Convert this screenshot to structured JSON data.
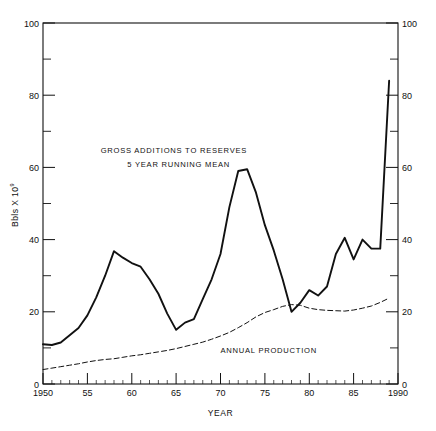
{
  "chart_data": {
    "type": "line",
    "title": "",
    "xlabel": "YEAR",
    "ylabel": "Bbls X 10",
    "ylabel_exponent": "9",
    "xlim": [
      1950,
      1990
    ],
    "ylim": [
      0,
      100
    ],
    "grid": false,
    "legend_position": "inline-annotation",
    "xticks": [
      1950,
      1955,
      1960,
      1965,
      1970,
      1975,
      1980,
      1985,
      1990
    ],
    "xtick_labels": [
      "1950",
      "55",
      "60",
      "65",
      "70",
      "75",
      "80",
      "85",
      "1990"
    ],
    "xminor_step": 1,
    "yticks": [
      0,
      20,
      40,
      60,
      80,
      100
    ],
    "ytick_labels": [
      "0",
      "20",
      "40",
      "60",
      "80",
      "100"
    ],
    "yminor_ticks": [
      10,
      30,
      50,
      70,
      90
    ],
    "right_axis_ticks": [
      0,
      20,
      40,
      60,
      80,
      100
    ],
    "right_axis_tick_labels": [
      "0",
      "20",
      "40",
      "60",
      "80",
      "100"
    ],
    "annotations": [
      {
        "name": "gross-additions-label-line1",
        "text": "GROSS ADDITIONS TO RESERVES",
        "x": 1956.5,
        "y": 64
      },
      {
        "name": "gross-additions-label-line2",
        "text": "5 YEAR RUNNING MEAN",
        "x": 1959.5,
        "y": 60
      },
      {
        "name": "annual-production-label",
        "text": "ANNUAL PRODUCTION",
        "x": 1970.0,
        "y": 8.5
      }
    ],
    "series": [
      {
        "name": "GROSS ADDITIONS TO RESERVES 5 YEAR RUNNING MEAN",
        "style": "solid",
        "linewidth": 1.9,
        "color": "#111111",
        "x": [
          1950,
          1951,
          1952,
          1953,
          1954,
          1955,
          1956,
          1957,
          1958,
          1959,
          1960,
          1961,
          1962,
          1963,
          1964,
          1965,
          1966,
          1967,
          1968,
          1969,
          1970,
          1971,
          1972,
          1973,
          1974,
          1975,
          1976,
          1977,
          1978,
          1979,
          1980,
          1981,
          1982,
          1983,
          1984,
          1985,
          1986,
          1987,
          1988,
          1989
        ],
        "values": [
          11.0,
          10.8,
          11.5,
          13.5,
          15.5,
          19.0,
          24.0,
          30.0,
          36.8,
          35.0,
          33.5,
          32.5,
          29.0,
          25.0,
          19.5,
          15.0,
          17.0,
          18.0,
          23.5,
          29.0,
          36.0,
          49.0,
          59.0,
          59.5,
          53.0,
          44.0,
          37.0,
          29.0,
          20.0,
          22.5,
          26.0,
          24.5,
          27.0,
          36.0,
          40.5,
          34.5,
          40.0,
          37.5,
          37.5,
          84.0
        ]
      },
      {
        "name": "ANNUAL PRODUCTION",
        "style": "dashed",
        "linewidth": 1.0,
        "color": "#111111",
        "x": [
          1950,
          1951,
          1952,
          1953,
          1954,
          1955,
          1956,
          1957,
          1958,
          1959,
          1960,
          1961,
          1962,
          1963,
          1964,
          1965,
          1966,
          1967,
          1968,
          1969,
          1970,
          1971,
          1972,
          1973,
          1974,
          1975,
          1976,
          1977,
          1978,
          1979,
          1980,
          1981,
          1982,
          1983,
          1984,
          1985,
          1986,
          1987,
          1988,
          1989
        ],
        "values": [
          4.0,
          4.4,
          4.8,
          5.2,
          5.6,
          6.1,
          6.5,
          6.8,
          7.0,
          7.4,
          7.8,
          8.1,
          8.5,
          8.9,
          9.3,
          9.8,
          10.4,
          11.0,
          11.6,
          12.4,
          13.3,
          14.3,
          15.6,
          17.0,
          18.6,
          19.8,
          20.6,
          21.5,
          22.0,
          21.8,
          21.0,
          20.6,
          20.4,
          20.3,
          20.2,
          20.5,
          21.0,
          21.6,
          22.6,
          23.8
        ]
      }
    ]
  },
  "figure": {
    "y_axis_title_prefix": "Bbls X 10",
    "y_axis_title_exponent": "9",
    "x_axis_title": "YEAR"
  }
}
